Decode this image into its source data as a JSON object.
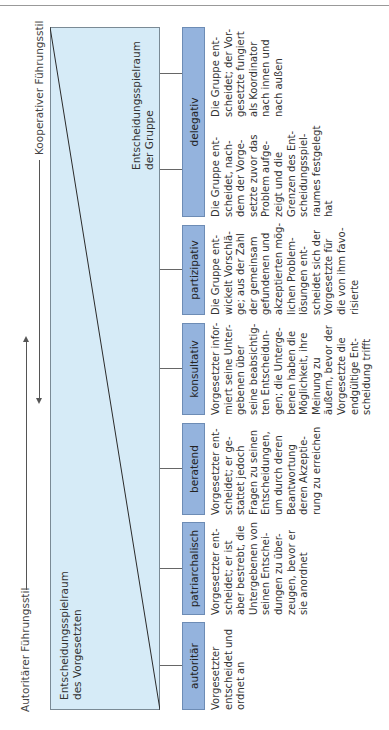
{
  "axis": {
    "left_label": "Autoritärer Führungsstil",
    "right_label": "Kooperativer Führungsstil"
  },
  "areas": {
    "superior": "Entscheidungsspielraum\ndes Vorgesetzten",
    "group": "Entscheidungsspielraum\nder Gruppe"
  },
  "styles": [
    {
      "label": "autoritär",
      "text": "Vorgesetzter\nentscheidet und\nordnet an"
    },
    {
      "label": "patriarchalisch",
      "text": "Vorgesetzter ent-\nscheidet; er ist\naber bestrebt, die\nUntergebenen von\nseinen Entschei-\ndungen zu über-\nzeugen, bevor er\nsie anordnet"
    },
    {
      "label": "beratend",
      "text": "Vorgesetzter ent-\nscheidet; er ge-\nstattet jedoch\nFragen zu seinen\nEntscheidungen,\num durch deren\nBeantwortung\nderen Akzeptie-\nrung zu erreichen"
    },
    {
      "label": "konsultativ",
      "text": "Vorgesetzter infor-\nmiert seine Unter-\ngebenen über\nseine beabsichtig-\nten Entscheidun-\ngen; die Unterge-\nbenen haben die\nMöglichkeit, ihre\nMeinung zu\näußern, bevor der\nVorgesetzte die\nendgültige Ent-\nscheidung trifft"
    },
    {
      "label": "partizipativ",
      "text": "Die Gruppe ent-\nwickelt Vorschlä-\nge; aus der Zahl\nder gemeinsam\ngefundenen und\nakzeptierten mög-\nlichen Problem-\nlösungen ent-\nscheidet sich der\nVorgesetzte für\ndie von ihm favo-\nrisierte"
    },
    {
      "label": "delegativ",
      "text_a": "Die Gruppe ent-\nscheidet, nach-\ndem der Vorge-\nsetzte zuvor das\nProblem aufge-\nzeigt und die\nGrenzen des Ent-\nscheidungsspiel-\nraumes festgelegt\nhat",
      "text_b": "Die Gruppe ent-\nscheidet; der Vor-\ngesetzte fungiert\nals Koordinator\nnach innen und\nnach außen"
    }
  ],
  "colors": {
    "area_fill": "#d6ebf7",
    "label_fill": "#94b3dd"
  }
}
